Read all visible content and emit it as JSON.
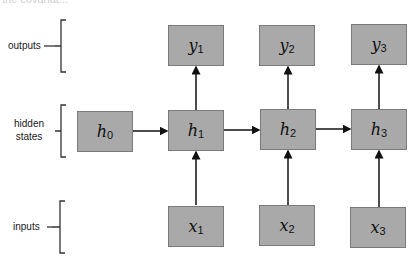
{
  "clipped_text": "the covariat...",
  "rows": {
    "outputs": {
      "label": "outputs"
    },
    "hidden": {
      "label_line1": "hidden",
      "label_line2": "states"
    },
    "inputs": {
      "label": "inputs"
    }
  },
  "nodes": {
    "outputs": [
      {
        "var": "y",
        "sub": "1"
      },
      {
        "var": "y",
        "sub": "2"
      },
      {
        "var": "y",
        "sub": "3"
      }
    ],
    "hidden": [
      {
        "var": "h",
        "sub": "0"
      },
      {
        "var": "h",
        "sub": "1"
      },
      {
        "var": "h",
        "sub": "2"
      },
      {
        "var": "h",
        "sub": "3"
      }
    ],
    "inputs": [
      {
        "var": "x",
        "sub": "1"
      },
      {
        "var": "x",
        "sub": "2"
      },
      {
        "var": "x",
        "sub": "3"
      }
    ]
  },
  "colors": {
    "node_fill": "#a9a9a9",
    "edge": "#111111"
  }
}
